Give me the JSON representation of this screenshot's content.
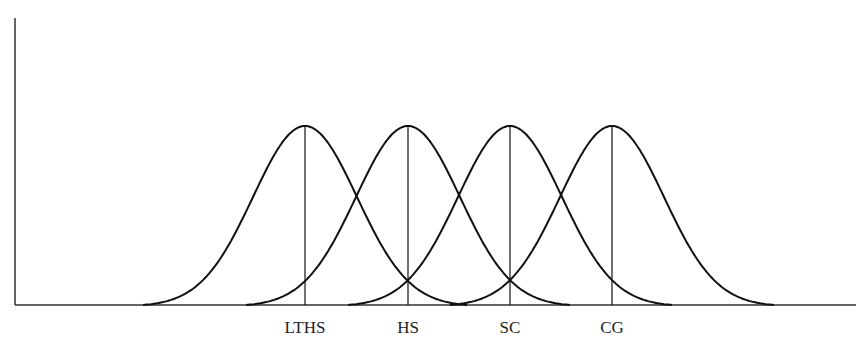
{
  "chart_data": {
    "type": "line",
    "title": "",
    "xlabel": "",
    "ylabel": "",
    "grid": false,
    "legend": "none",
    "series": [
      {
        "name": "LTHS",
        "center": 305,
        "peak": 1.0
      },
      {
        "name": "HS",
        "center": 408,
        "peak": 1.0
      },
      {
        "name": "SC",
        "center": 510,
        "peak": 1.0
      },
      {
        "name": "CG",
        "center": 612,
        "peak": 1.0
      }
    ],
    "categories": [
      "LTHS",
      "HS",
      "SC",
      "CG"
    ]
  },
  "labels": {
    "lths": "LTHS",
    "hs": "HS",
    "sc": "SC",
    "cg": "CG"
  },
  "colors": {
    "line": "#111111",
    "axis": "#333333",
    "background": "#ffffff"
  }
}
